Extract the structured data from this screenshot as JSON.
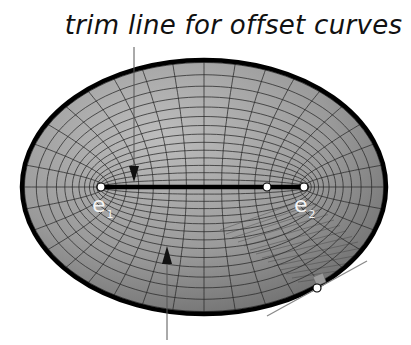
{
  "diagram": {
    "title": "trim line for offset curves",
    "labels": {
      "e1": {
        "base": "e",
        "sub": "1"
      },
      "e2": {
        "base": "e",
        "sub": "2"
      }
    },
    "ellipse": {
      "cx": 204,
      "cy": 187,
      "rx": 182,
      "ry": 127
    },
    "foci": {
      "e1": {
        "x": 101,
        "y": 187
      },
      "e2": {
        "x": 304,
        "y": 187
      }
    },
    "inner_point": {
      "x": 267,
      "y": 187
    },
    "tangent_point": {
      "x": 317,
      "y": 288
    },
    "colors": {
      "fill_light": "#b4b4b4",
      "fill_dark": "#6e6e6e",
      "grid": "#2a2a2a",
      "outline": "#000000",
      "segment": "#000000",
      "point": "#ffffff",
      "label": "#f4f4f4",
      "leader": "#555555",
      "tangent": "#888888"
    }
  }
}
